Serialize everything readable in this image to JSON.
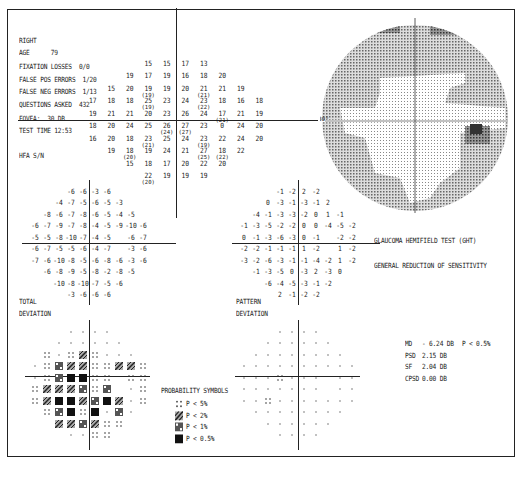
{
  "header": {
    "eye": "RIGHT",
    "age_label": "AGE",
    "age": "79",
    "fixation_losses_label": "FIXATION LOSSES",
    "fixation_losses": "0/0",
    "false_pos_label": "FALSE POS ERRORS",
    "false_pos": "1/20",
    "false_neg_label": "FALSE NEG ERRORS",
    "false_neg": "1/13",
    "questions_label": "QUESTIONS ASKED",
    "questions": "432",
    "fovea_label": "FOVEA:",
    "fovea": "30 DB",
    "test_time_label": "TEST TIME",
    "test_time": "12:53",
    "hfa": "HFA S/N"
  },
  "threshold_map": {
    "rows": [
      [
        "",
        "",
        "",
        "15",
        "15",
        "17",
        "13",
        "",
        "",
        ""
      ],
      [
        "",
        "",
        "19",
        "17",
        "19",
        "16",
        "18",
        "20",
        "",
        ""
      ],
      [
        "",
        "15",
        "20",
        "19",
        "19",
        "20",
        "21",
        "21",
        "19",
        ""
      ],
      [
        "17",
        "18",
        "18",
        "25",
        "23",
        "24",
        "23",
        "18",
        "16",
        "18"
      ],
      [
        "19",
        "21",
        "21",
        "20",
        "23",
        "26",
        "24",
        "17",
        "21",
        "19"
      ],
      [
        "18",
        "20",
        "24",
        "25",
        "26",
        "27",
        "23",
        "0",
        "24",
        "20"
      ],
      [
        "16",
        "20",
        "18",
        "23",
        "25",
        "24",
        "23",
        "22",
        "24",
        "20"
      ],
      [
        "",
        "19",
        "18",
        "19",
        "24",
        "21",
        "27",
        "18",
        "22",
        ""
      ],
      [
        "",
        "",
        "15",
        "18",
        "17",
        "20",
        "22",
        "20",
        "",
        ""
      ],
      [
        "",
        "",
        "",
        "22",
        "19",
        "19",
        "19",
        "",
        "",
        ""
      ]
    ],
    "retests": [
      {
        "row": 2,
        "col": 3,
        "value": "(19)"
      },
      {
        "row": 2,
        "col": 6,
        "value": "(21)"
      },
      {
        "row": 3,
        "col": 3,
        "value": "(19)"
      },
      {
        "row": 3,
        "col": 6,
        "value": "(22)"
      },
      {
        "row": 4,
        "col": 7,
        "value": "(21)"
      },
      {
        "row": 5,
        "col": 4,
        "value": "(24)"
      },
      {
        "row": 5,
        "col": 5,
        "value": "(27)"
      },
      {
        "row": 6,
        "col": 3,
        "value": "(21)"
      },
      {
        "row": 6,
        "col": 6,
        "value": "(19)"
      },
      {
        "row": 7,
        "col": 2,
        "value": "(20)"
      },
      {
        "row": 7,
        "col": 6,
        "value": "(25)"
      },
      {
        "row": 7,
        "col": 7,
        "value": "(22)"
      },
      {
        "row": 9,
        "col": 3,
        "value": "(20)"
      }
    ]
  },
  "grayscale": {
    "label_30": "30°"
  },
  "total_deviation": {
    "label_line1": "TOTAL",
    "label_line2": "DEVIATION",
    "rows": [
      [
        "",
        "",
        "",
        "-6",
        "-6",
        "-3",
        "-6",
        "",
        "",
        ""
      ],
      [
        "",
        "",
        "-4",
        "-7",
        "-5",
        "-6",
        "-5",
        "-3",
        "",
        ""
      ],
      [
        "",
        "-8",
        "-6",
        "-7",
        "-8",
        "-6",
        "-5",
        "-4",
        "-5",
        ""
      ],
      [
        "-6",
        "-7",
        "-9",
        "-7",
        "-8",
        "-4",
        "-5",
        "-9",
        "-10",
        "-6"
      ],
      [
        "-5",
        "-5",
        "-8",
        "-10",
        "-7",
        "-4",
        "-5",
        "",
        "-6",
        "-7"
      ],
      [
        "-6",
        "-7",
        "-5",
        "-5",
        "-6",
        "-4",
        "-7",
        "",
        "-3",
        "-6"
      ],
      [
        "-7",
        "-6",
        "-10",
        "-8",
        "-5",
        "-6",
        "-8",
        "-6",
        "-3",
        "-6"
      ],
      [
        "",
        "-6",
        "-8",
        "-9",
        "-5",
        "-8",
        "-2",
        "-8",
        "-5",
        ""
      ],
      [
        "",
        "",
        "-10",
        "-8",
        "-10",
        "-7",
        "-5",
        "-6",
        "",
        ""
      ],
      [
        "",
        "",
        "",
        "-3",
        "-6",
        "-6",
        "-6",
        "",
        "",
        ""
      ]
    ]
  },
  "pattern_deviation": {
    "label_line1": "PATTERN",
    "label_line2": "DEVIATION",
    "rows": [
      [
        "",
        "",
        "",
        "-1",
        "-2",
        "2",
        "-2",
        "",
        "",
        ""
      ],
      [
        "",
        "",
        "0",
        "-3",
        "-1",
        "-3",
        "-1",
        "2",
        "",
        ""
      ],
      [
        "",
        "-4",
        "-1",
        "-3",
        "-3",
        "-2",
        "0",
        "1",
        "-1",
        ""
      ],
      [
        "-1",
        "-3",
        "-5",
        "-2",
        "-2",
        "0",
        "0",
        "-4",
        "-5",
        "-2"
      ],
      [
        "0",
        "-1",
        "-3",
        "-6",
        "-3",
        "0",
        "-1",
        "",
        "-2",
        "-2"
      ],
      [
        "-2",
        "-2",
        "-1",
        "-1",
        "-1",
        "1",
        "-2",
        "",
        "1",
        "-2"
      ],
      [
        "-3",
        "-2",
        "-6",
        "-3",
        "-1",
        "-1",
        "-4",
        "-2",
        "1",
        "-2"
      ],
      [
        "",
        "-1",
        "-3",
        "-5",
        "0",
        "-3",
        "2",
        "-3",
        "0",
        ""
      ],
      [
        "",
        "",
        "-6",
        "-4",
        "-5",
        "-3",
        "-1",
        "-2",
        "",
        ""
      ],
      [
        "",
        "",
        "",
        "2",
        "-1",
        "-2",
        "-2",
        "",
        "",
        ""
      ]
    ]
  },
  "total_prob": {
    "rows": [
      [
        "",
        "",
        "",
        "d",
        "d",
        "d",
        "d",
        "",
        "",
        ""
      ],
      [
        "",
        "",
        "d",
        "d",
        "d",
        "d",
        "d",
        "d",
        "",
        ""
      ],
      [
        "",
        "5",
        "d",
        "5",
        "2",
        "5",
        "d",
        "d",
        "d",
        ""
      ],
      [
        "d",
        "5",
        "1",
        "2",
        "2",
        "5",
        "5",
        "2",
        "2",
        "5"
      ],
      [
        "d",
        "5",
        "1",
        "0",
        "0",
        "5",
        "5",
        "",
        "5",
        "5"
      ],
      [
        "5",
        "2",
        "2",
        "2",
        "1",
        "5",
        "1",
        "",
        "d",
        "5"
      ],
      [
        "5",
        "2",
        "0",
        "0",
        "2",
        "1",
        "0",
        "2",
        "d",
        "5"
      ],
      [
        "",
        "5",
        "1",
        "0",
        "5",
        "0",
        "d",
        "1",
        "d",
        ""
      ],
      [
        "",
        "",
        "2",
        "2",
        "1",
        "2",
        "5",
        "5",
        "",
        ""
      ],
      [
        "",
        "",
        "",
        "d",
        "d",
        "5",
        "5",
        "",
        "",
        ""
      ]
    ]
  },
  "pattern_prob": {
    "rows": [
      [
        "",
        "",
        "",
        "d",
        "d",
        "d",
        "d",
        "",
        "",
        ""
      ],
      [
        "",
        "",
        "d",
        "d",
        "d",
        "d",
        "d",
        "d",
        "",
        ""
      ],
      [
        "",
        "d",
        "d",
        "d",
        "d",
        "d",
        "d",
        "d",
        "d",
        ""
      ],
      [
        "d",
        "d",
        "d",
        "d",
        "d",
        "d",
        "d",
        "d",
        "d",
        "d"
      ],
      [
        "d",
        "d",
        "d",
        "5",
        "d",
        "d",
        "d",
        "",
        "d",
        "d"
      ],
      [
        "d",
        "d",
        "d",
        "d",
        "d",
        "d",
        "d",
        "",
        "d",
        "d"
      ],
      [
        "d",
        "d",
        "5",
        "d",
        "d",
        "d",
        "d",
        "d",
        "d",
        "d"
      ],
      [
        "",
        "d",
        "d",
        "d",
        "d",
        "d",
        "d",
        "d",
        "d",
        ""
      ],
      [
        "",
        "",
        "d",
        "d",
        "d",
        "d",
        "d",
        "d",
        "",
        ""
      ],
      [
        "",
        "",
        "",
        "d",
        "d",
        "d",
        "d",
        "",
        "",
        ""
      ]
    ]
  },
  "legend": {
    "title": "PROBABILITY SYMBOLS",
    "items": [
      {
        "symbol": "p5",
        "label": "P <  5%"
      },
      {
        "symbol": "p2",
        "label": "P <  2%"
      },
      {
        "symbol": "p1",
        "label": "P <  1%"
      },
      {
        "symbol": "p05",
        "label": "P < 0.5%"
      }
    ]
  },
  "ght": {
    "title": "GLAUCOMA HEMIFIELD TEST (GHT)",
    "result": "GENERAL REDUCTION OF SENSITIVITY"
  },
  "indices": [
    {
      "label": "MD",
      "value": "- 6.24 DB",
      "p": "P < 0.5%"
    },
    {
      "label": "PSD",
      "value": "2.15 DB",
      "p": ""
    },
    {
      "label": "SF",
      "value": "2.04 DB",
      "p": ""
    },
    {
      "label": "CPSD",
      "value": "0.00 DB",
      "p": ""
    }
  ],
  "colors": {
    "ink": "#1a1a1a",
    "paper": "#ffffff",
    "dark": "#555555",
    "mid": "#8a8a8a",
    "light": "#c8c8c8"
  }
}
